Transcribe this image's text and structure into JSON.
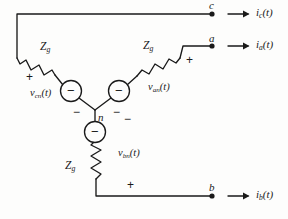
{
  "figure": {
    "type": "circuit-schematic",
    "background_color": "#fdfdfc",
    "line_color": "#1a1a1a"
  },
  "terminals": [
    {
      "id": "c",
      "label": "c",
      "current_label": "i",
      "current_sub": "c",
      "current_arg": "(t)"
    },
    {
      "id": "a",
      "label": "a",
      "current_label": "i",
      "current_sub": "a",
      "current_arg": "(t)"
    },
    {
      "id": "b",
      "label": "b",
      "current_label": "i",
      "current_sub": "b",
      "current_arg": "(t)"
    }
  ],
  "impedances": [
    {
      "id": "zg-c",
      "symbol": "Z",
      "sub": "g"
    },
    {
      "id": "zg-a",
      "symbol": "Z",
      "sub": "g"
    },
    {
      "id": "zg-b",
      "symbol": "Z",
      "sub": "g"
    }
  ],
  "sources": [
    {
      "id": "vcn",
      "symbol": "v",
      "sub": "cn",
      "arg": "(t)",
      "inner_sign": "−"
    },
    {
      "id": "van",
      "symbol": "v",
      "sub": "an",
      "arg": "(t)",
      "inner_sign": "−"
    },
    {
      "id": "vbn",
      "symbol": "v",
      "sub": "bn",
      "arg": "(t)",
      "inner_sign": "−"
    }
  ],
  "node": {
    "id": "n",
    "label": "n"
  },
  "polarity_marks": {
    "plus": "+",
    "minus": "−",
    "plus_count": 3,
    "minus_count": 3
  }
}
